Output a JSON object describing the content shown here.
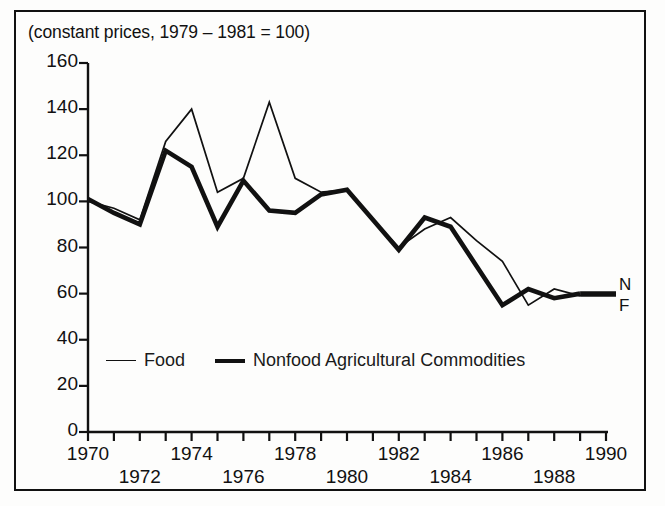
{
  "figure": {
    "caption": "(constant prices, 1979 – 1981 = 100)",
    "background_color": "#fdfdfc",
    "border_color": "#111111"
  },
  "legend": {
    "food_label": "Food",
    "nonfood_label": "Nonfood Agricultural Commodities",
    "food_icon": "thin-line-swatch",
    "nonfood_icon": "thick-line-swatch"
  },
  "end_labels": {
    "nonfood": "N",
    "food": "F"
  },
  "axes": {
    "y_ticks": [
      "160",
      "140",
      "120",
      "100",
      "80",
      "60",
      "40",
      "20",
      "0"
    ],
    "x_ticks_upper": [
      "1970",
      "1974",
      "1978",
      "1982",
      "1986",
      "1990"
    ],
    "x_ticks_lower": [
      "1972",
      "1976",
      "1980",
      "1984",
      "1988"
    ],
    "x_ticks_all": [
      "1970",
      "1972",
      "1974",
      "1976",
      "1978",
      "1980",
      "1982",
      "1984",
      "1986",
      "1988",
      "1990"
    ]
  },
  "chart_data": {
    "type": "line",
    "title": "(constant prices, 1979 – 1981 = 100)",
    "xlabel": "",
    "ylabel": "",
    "xlim": [
      1970,
      1990
    ],
    "ylim": [
      0,
      160
    ],
    "ytick_step": 20,
    "xtick_step": 1,
    "grid": false,
    "legend_position": "inside-bottom-left",
    "x": [
      1970,
      1971,
      1972,
      1973,
      1974,
      1975,
      1976,
      1977,
      1978,
      1979,
      1980,
      1981,
      1982,
      1983,
      1984,
      1985,
      1986,
      1987,
      1988,
      1989
    ],
    "series": [
      {
        "name": "Food",
        "style": "thin",
        "color": "#111111",
        "values": [
          100,
          97,
          92,
          126,
          140,
          104,
          110,
          143,
          110,
          104,
          105,
          92,
          80,
          88,
          93,
          83,
          74,
          55,
          62,
          59
        ]
      },
      {
        "name": "Nonfood Agricultural Commodities",
        "style": "thick",
        "color": "#111111",
        "values": [
          101,
          95,
          90,
          122,
          115,
          89,
          109,
          96,
          95,
          103,
          105,
          92,
          79,
          93,
          89,
          72,
          55,
          62,
          58,
          60
        ]
      }
    ]
  }
}
